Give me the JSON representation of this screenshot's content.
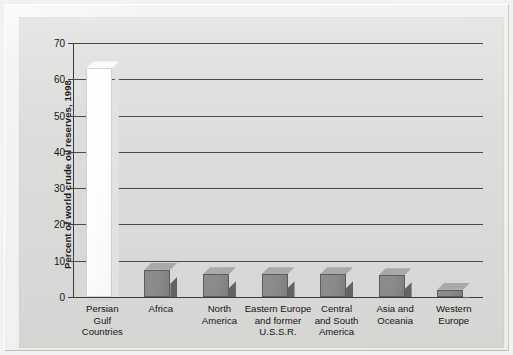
{
  "figure": {
    "background_color": "#dcdcda",
    "frame_color": "#f2f2f0"
  },
  "chart_data": {
    "type": "bar",
    "title": "",
    "subtitle": "",
    "xlabel": "",
    "ylabel": "Percent of world crude oil reserves, 1998",
    "ylim": [
      0,
      70
    ],
    "ytick_values": [
      0,
      10,
      20,
      30,
      40,
      50,
      60,
      70
    ],
    "ytick_labels": [
      "0",
      "10",
      "20",
      "30",
      "40",
      "50",
      "60",
      "70"
    ],
    "grid": true,
    "legend": null,
    "legend_position": "none",
    "categories": [
      "Persian Gulf Countries",
      "Africa",
      "North America",
      "Eastern Europe and former U.S.S.R.",
      "Central and South America",
      "Asia and Oceania",
      "Western Europe"
    ],
    "category_lines": [
      [
        "Persian",
        "Gulf",
        "Countries"
      ],
      [
        "Africa"
      ],
      [
        "North",
        "America"
      ],
      [
        "Eastern Europe",
        "and former",
        "U.S.S.R."
      ],
      [
        "Central",
        "and South",
        "America"
      ],
      [
        "Asia and",
        "Oceania"
      ],
      [
        "Western",
        "Europe"
      ]
    ],
    "values": [
      63,
      7.5,
      6.3,
      6.3,
      6.3,
      6.0,
      2.0
    ],
    "bar_styles": [
      "white",
      "gray",
      "gray",
      "gray",
      "gray",
      "gray",
      "gray"
    ],
    "colors": {
      "highlight_bar": "#ffffff",
      "bar_front": "#8a8a8a",
      "bar_side": "#636363",
      "bar_top": "#a9a9a9",
      "gridline": "#4a4a4a",
      "axis": "#3c3c3c",
      "plot_background": "#dcdcda",
      "text": "#151515"
    }
  }
}
